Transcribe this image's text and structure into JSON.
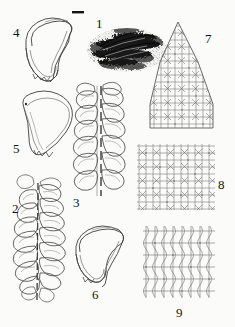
{
  "plate": {
    "kind": "botanical-illustration-plate",
    "background_color": "#fbfbf9",
    "ink_color": "#1a1a1a",
    "line_color": "#555555",
    "figure_count": 9,
    "scale_bar": {
      "name": "scale-bar",
      "shown": true,
      "label": "",
      "x": 72,
      "y": 12,
      "width": 12,
      "height": 2
    },
    "figures": [
      {
        "number": "1",
        "label_x": 96,
        "label_y": 17,
        "subject": "habit-of-plant-on-substrate",
        "style": "dense-black-stipple"
      },
      {
        "number": "2",
        "label_x": 12,
        "label_y": 202,
        "subject": "leafy-shoot-ventral-view",
        "style": "outline"
      },
      {
        "number": "3",
        "label_x": 73,
        "label_y": 196,
        "subject": "leafy-shoot-dorsal-view",
        "style": "outline"
      },
      {
        "number": "4",
        "label_x": 13,
        "label_y": 26,
        "subject": "leaf-with-lobule",
        "style": "outline"
      },
      {
        "number": "5",
        "label_x": 13,
        "label_y": 142,
        "subject": "leaf-with-lobule",
        "style": "outline"
      },
      {
        "number": "6",
        "label_x": 92,
        "label_y": 288,
        "subject": "leaf-with-lobule",
        "style": "outline"
      },
      {
        "number": "7",
        "label_x": 205,
        "label_y": 32,
        "subject": "leaf-apex-cells",
        "style": "areolation"
      },
      {
        "number": "8",
        "label_x": 218,
        "label_y": 178,
        "subject": "median-leaf-cells",
        "style": "areolation"
      },
      {
        "number": "9",
        "label_x": 176,
        "label_y": 306,
        "subject": "basal-leaf-cells",
        "style": "areolation"
      }
    ]
  }
}
